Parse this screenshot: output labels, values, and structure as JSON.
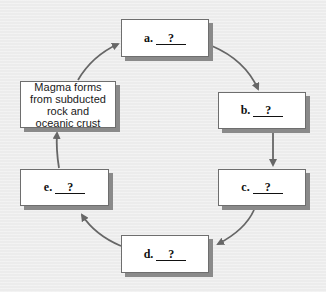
{
  "diagram": {
    "type": "cycle",
    "boxes": [
      {
        "id": "a",
        "letter": "a.",
        "blank": "?"
      },
      {
        "id": "b",
        "letter": "b.",
        "blank": "?"
      },
      {
        "id": "c",
        "letter": "c.",
        "blank": "?"
      },
      {
        "id": "d",
        "letter": "d.",
        "blank": "?"
      },
      {
        "id": "e",
        "letter": "e.",
        "blank": "?"
      }
    ],
    "start_box": {
      "text": "Magma forms from subducted rock and oceanic crust",
      "lines": [
        "Magma forms",
        "from subducted",
        "rock and",
        "oceanic crust"
      ]
    },
    "flow": [
      "start",
      "a",
      "b",
      "c",
      "d",
      "e",
      "start"
    ],
    "colors": {
      "background": "#eeeeee",
      "box_fill": "#ffffff",
      "box_border": "#6e6e6e",
      "box_shadow": "#8a8a8a",
      "arrow": "#666666",
      "text": "#111111"
    }
  }
}
